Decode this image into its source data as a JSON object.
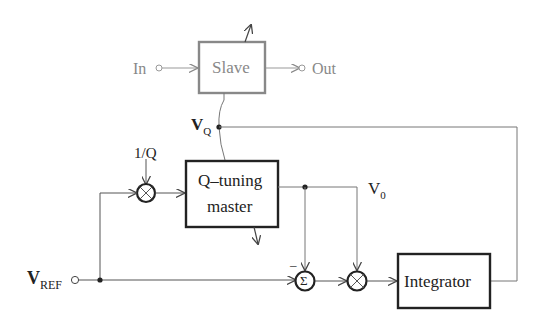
{
  "diagram": {
    "blocks": {
      "slave": {
        "label": "Slave"
      },
      "master": {
        "line1": "Q–tuning",
        "line2": "master"
      },
      "integrator": {
        "label": "Integrator"
      }
    },
    "terminals": {
      "in": "In",
      "out": "Out",
      "vref_main": "V",
      "vref_sub": "REF"
    },
    "signals": {
      "vq_main": "V",
      "vq_sub": "Q",
      "v0_main": "V",
      "v0_sub": "0",
      "inv_q": "1/Q",
      "minus": "–"
    },
    "operators": {
      "sum": "Σ"
    },
    "colors": {
      "line": "#555555",
      "slave_gray": "#888888",
      "box_border": "#222222"
    }
  }
}
